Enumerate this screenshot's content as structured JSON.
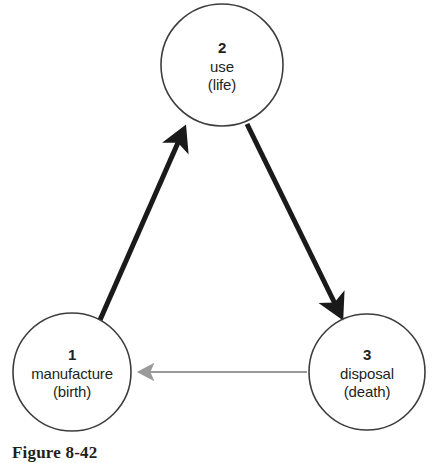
{
  "figure": {
    "caption": "Figure 8-42",
    "background_color": "#ffffff"
  },
  "diagram": {
    "type": "cycle-diagram",
    "node_outline_color": "#3d3d3d",
    "node_fill_color": "#ffffff",
    "text_color": "#231f20",
    "nodes": [
      {
        "id": "node-1",
        "number": "1",
        "name": "manufacture",
        "sub": "(birth)",
        "cx": 72,
        "cy": 372,
        "r": 59
      },
      {
        "id": "node-2",
        "number": "2",
        "name": "use",
        "sub": "(life)",
        "cx": 222,
        "cy": 65,
        "r": 61
      },
      {
        "id": "node-3",
        "number": "3",
        "name": "disposal",
        "sub": "(death)",
        "cx": 367,
        "cy": 372,
        "r": 58
      }
    ],
    "arrows": [
      {
        "id": "arrow-1-to-2",
        "from": "node-1",
        "to": "node-2",
        "color": "#1a1a1a",
        "width": 5,
        "style": "solid-thick"
      },
      {
        "id": "arrow-2-to-3",
        "from": "node-2",
        "to": "node-3",
        "color": "#1a1a1a",
        "width": 5,
        "style": "solid-thick"
      },
      {
        "id": "arrow-3-to-1",
        "from": "node-3",
        "to": "node-1",
        "color": "#9a9a9a",
        "width": 2,
        "style": "solid-thin"
      }
    ]
  }
}
